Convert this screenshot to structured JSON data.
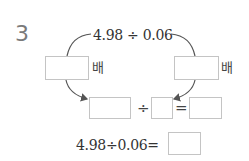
{
  "problem": {
    "number": "3",
    "top_expression": "4.98 ÷ 0.06",
    "left_multiplier_label": "배",
    "right_multiplier_label": "배",
    "left_multiplier_value": "",
    "right_multiplier_value": "",
    "equation_row": {
      "dividend_value": "",
      "divide_symbol": "÷",
      "divisor_value": "",
      "equals_symbol": "=",
      "quotient_value": ""
    },
    "final_expression": "4.98÷0.06=",
    "final_answer_value": ""
  },
  "colors": {
    "box_border": "#c4c4c4",
    "arrow": "#555555",
    "number": "#7a7a7a"
  }
}
